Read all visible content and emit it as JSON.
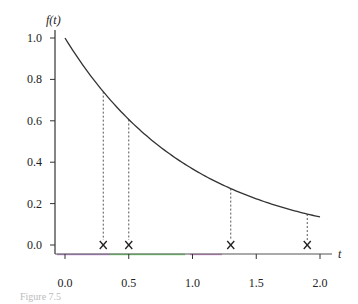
{
  "chart_data": {
    "type": "line",
    "title": "",
    "xlabel": "t",
    "ylabel": "f(t)",
    "xlim": [
      0.0,
      2.0
    ],
    "ylim": [
      0.0,
      1.0
    ],
    "grid": false,
    "x_ticks": [
      "0.0",
      "0.5",
      "1.0",
      "1.5",
      "2.0"
    ],
    "y_ticks": [
      "0.0",
      "0.2",
      "0.4",
      "0.6",
      "0.8",
      "1.0"
    ],
    "series": [
      {
        "name": "f(t)",
        "function": "exp(-t)",
        "x": [
          0.0,
          0.25,
          0.5,
          0.75,
          1.0,
          1.25,
          1.5,
          1.75,
          2.0
        ],
        "values": [
          1.0,
          0.78,
          0.61,
          0.47,
          0.37,
          0.29,
          0.22,
          0.17,
          0.135
        ]
      }
    ],
    "markers": {
      "symbol": "x",
      "y": 0.0,
      "x": [
        0.3,
        0.5,
        1.3,
        1.9
      ],
      "curve_values": [
        0.74,
        0.61,
        0.27,
        0.15
      ],
      "connector": "dashed vertical line to curve"
    }
  },
  "axes": {
    "y_label": "f(t)",
    "x_label": "t"
  },
  "caption": "Figure 7.5"
}
